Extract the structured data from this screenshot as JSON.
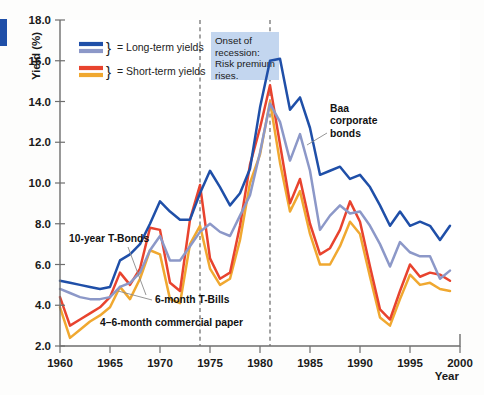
{
  "chart_data": {
    "type": "line",
    "title": "",
    "xlabel": "Year",
    "ylabel": "Yield (%)",
    "xlim": [
      1960,
      2000
    ],
    "ylim": [
      2.0,
      18.0
    ],
    "grid": false,
    "legend_position": "top-left-inside",
    "x_ticks": [
      "1960",
      "1965",
      "1970",
      "1975",
      "1980",
      "1985",
      "1990",
      "1995",
      "2000"
    ],
    "y_ticks": [
      "2.0",
      "4.0",
      "6.0",
      "8.0",
      "10.0",
      "12.0",
      "14.0",
      "16.0",
      "18.0"
    ],
    "x": [
      1960,
      1961,
      1962,
      1963,
      1964,
      1965,
      1966,
      1967,
      1968,
      1969,
      1970,
      1971,
      1972,
      1973,
      1974,
      1975,
      1976,
      1977,
      1978,
      1979,
      1980,
      1981,
      1982,
      1983,
      1984,
      1985,
      1986,
      1987,
      1988,
      1989,
      1990,
      1991,
      1992,
      1993,
      1994,
      1995,
      1996,
      1997,
      1998,
      1999
    ],
    "series": [
      {
        "name": "Baa corporate bonds",
        "color": "#1f4fa8",
        "group": "long-term",
        "values": [
          5.2,
          5.1,
          5.0,
          4.9,
          4.8,
          4.9,
          6.2,
          6.5,
          7.0,
          8.0,
          9.1,
          8.6,
          8.2,
          8.2,
          9.5,
          10.6,
          9.8,
          8.9,
          9.5,
          10.7,
          13.7,
          16.0,
          16.1,
          13.6,
          14.2,
          12.7,
          10.4,
          10.6,
          10.8,
          10.2,
          10.4,
          9.8,
          8.9,
          7.9,
          8.6,
          7.9,
          8.1,
          7.9,
          7.2,
          7.9
        ]
      },
      {
        "name": "10-year T-Bonds",
        "color": "#8c98c8",
        "group": "long-term",
        "values": [
          4.8,
          4.6,
          4.4,
          4.3,
          4.3,
          4.4,
          4.9,
          5.1,
          5.6,
          6.7,
          7.4,
          6.2,
          6.2,
          6.9,
          7.6,
          8.0,
          7.6,
          7.4,
          8.4,
          9.4,
          11.5,
          13.9,
          13.0,
          11.1,
          12.4,
          10.6,
          7.7,
          8.4,
          8.9,
          8.5,
          8.6,
          7.9,
          7.0,
          5.9,
          7.1,
          6.6,
          6.4,
          6.4,
          5.3,
          5.7
        ]
      },
      {
        "name": "4-6-month commercial paper",
        "color": "#e8432e",
        "group": "short-term",
        "values": [
          4.4,
          3.0,
          3.3,
          3.6,
          3.9,
          4.4,
          5.6,
          5.0,
          5.8,
          7.8,
          7.7,
          5.1,
          4.7,
          8.2,
          9.9,
          6.3,
          5.3,
          5.6,
          7.9,
          10.9,
          12.7,
          14.8,
          11.9,
          9.0,
          10.2,
          8.0,
          6.5,
          6.8,
          7.7,
          9.1,
          8.1,
          5.9,
          3.8,
          3.3,
          4.7,
          6.0,
          5.4,
          5.6,
          5.5,
          5.2
        ]
      },
      {
        "name": "6-month T-Bills",
        "color": "#f0a830",
        "group": "short-term",
        "values": [
          3.9,
          2.4,
          2.8,
          3.2,
          3.5,
          3.9,
          4.9,
          4.3,
          5.3,
          6.7,
          6.5,
          4.3,
          4.1,
          7.0,
          7.9,
          5.8,
          5.0,
          5.3,
          7.2,
          10.0,
          11.4,
          14.0,
          11.0,
          8.6,
          9.6,
          7.5,
          6.0,
          6.0,
          6.9,
          8.1,
          7.5,
          5.4,
          3.4,
          3.0,
          4.3,
          5.5,
          5.0,
          5.1,
          4.8,
          4.7
        ]
      }
    ],
    "legend": [
      {
        "label": "= Long-term yields",
        "colors": [
          "#1f4fa8",
          "#8c98c8"
        ]
      },
      {
        "label": "= Short-term yields",
        "colors": [
          "#e8432e",
          "#f0a830"
        ]
      }
    ],
    "annotations": [
      {
        "id": "recession-note",
        "text_lines": [
          "Onset of",
          "recession:",
          "Risk premium",
          "rises."
        ],
        "bg_color": "#c3d6ef"
      },
      {
        "id": "baa-label",
        "text_lines": [
          "Baa",
          "corporate",
          "bonds"
        ]
      },
      {
        "id": "tbonds-label",
        "text_lines": [
          "10-year T-Bonds"
        ]
      },
      {
        "id": "tbills-label",
        "text_lines": [
          "6-month T-Bills"
        ]
      },
      {
        "id": "cpaper-label",
        "text_lines": [
          "4–6-month commercial paper"
        ]
      }
    ],
    "reference_lines": [
      {
        "id": "recession-1974",
        "x": 1974
      },
      {
        "id": "recession-1981",
        "x": 1981
      }
    ]
  }
}
